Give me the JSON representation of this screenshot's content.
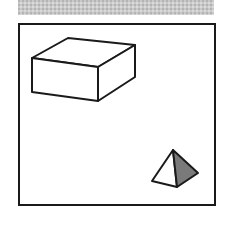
{
  "header_band": {
    "color": "#c9c9c9",
    "pattern": "dithered-gray"
  },
  "scene": {
    "frame": {
      "x": 18,
      "y": 23,
      "width": 196,
      "height": 181,
      "stroke": "#1a1a1a"
    },
    "objects": [
      {
        "type": "box",
        "name": "rectangular-box",
        "stroke": "#1a1a1a",
        "fill": "#ffffff",
        "vertices": {
          "front_top_left": [
            32,
            58
          ],
          "front_top_right": [
            98,
            67
          ],
          "back_top_left": [
            68,
            38
          ],
          "back_top_right": [
            135,
            45
          ],
          "front_bottom_left": [
            32,
            92
          ],
          "front_bottom_right": [
            98,
            101
          ],
          "back_bottom_right": [
            135,
            77
          ]
        }
      },
      {
        "type": "pyramid",
        "name": "tetrahedron",
        "stroke": "#1a1a1a",
        "light_face_fill": "#ffffff",
        "dark_face_fill": "#7a7a7a",
        "vertices": {
          "apex": [
            173,
            150
          ],
          "base_left": [
            152,
            181
          ],
          "base_front": [
            177,
            187
          ],
          "base_right": [
            198,
            173
          ]
        }
      }
    ]
  }
}
